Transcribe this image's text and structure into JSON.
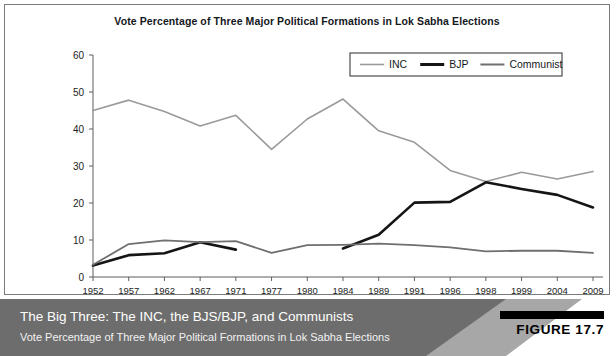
{
  "figure": {
    "number_label": "FIGURE 17.7",
    "caption_title": "The Big Three: The INC, the BJS/BJP, and Communists",
    "caption_subtitle": "Vote Percentage of Three Major Political Formations in Lok Sabha Elections"
  },
  "colors": {
    "inc": "#9a9a9a",
    "bjp": "#151515",
    "communist": "#6f6f6f",
    "axis": "#5d5d5d",
    "panel_border": "#7b7b7b",
    "caption_bg": "#6d6d6d",
    "caption_wedge": "#a7a7a7",
    "caption_wedge_light": "#ffffff",
    "text_light": "#ffffff",
    "text_dark": "#15181c"
  },
  "chart_data": {
    "type": "line",
    "title": "Vote Percentage of Three Major Political Formations in Lok Sabha Elections",
    "xlabel": "",
    "ylabel": "",
    "grid": false,
    "legend_position": "top-right",
    "categories": [
      "1952",
      "1957",
      "1962",
      "1967",
      "1971",
      "1977",
      "1980",
      "1984",
      "1989",
      "1991",
      "1996",
      "1998",
      "1999",
      "2004",
      "2009"
    ],
    "yticks": [
      0,
      10,
      20,
      30,
      40,
      50,
      60
    ],
    "ylim": [
      0,
      60
    ],
    "xtick_labels": [
      "1952",
      "1957",
      "1962",
      "1967",
      "1971",
      "1977",
      "1980",
      "1984",
      "1989",
      "1991",
      "1996",
      "1998",
      "1999",
      "2004",
      "2009"
    ],
    "series": [
      {
        "name": "INC",
        "color": "#9a9a9a",
        "values": [
          45.0,
          47.8,
          44.7,
          40.8,
          43.7,
          34.5,
          42.7,
          48.1,
          39.5,
          36.4,
          28.8,
          25.8,
          28.3,
          26.5,
          28.5
        ]
      },
      {
        "name": "BJP",
        "color": "#151515",
        "values": [
          3.1,
          5.9,
          6.4,
          9.4,
          7.4,
          null,
          null,
          7.7,
          11.4,
          20.1,
          20.3,
          25.6,
          23.8,
          22.2,
          18.8
        ]
      },
      {
        "name": "Communist",
        "color": "#6f6f6f",
        "values": [
          3.3,
          8.9,
          9.9,
          9.4,
          9.7,
          6.5,
          8.6,
          8.7,
          9.0,
          8.6,
          8.0,
          6.9,
          7.1,
          7.1,
          6.5
        ]
      }
    ]
  },
  "legend": {
    "items": [
      {
        "label": "INC",
        "color": "#9a9a9a",
        "thickness": 1.6
      },
      {
        "label": "BJP",
        "color": "#151515",
        "thickness": 3.0
      },
      {
        "label": "Communist",
        "color": "#6f6f6f",
        "thickness": 2.0
      }
    ]
  }
}
